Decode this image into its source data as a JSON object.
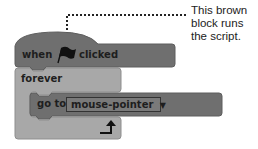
{
  "annotation": {
    "lines": [
      "This brown",
      "block runs",
      "the script."
    ]
  },
  "hat_block": {
    "label_before": "when",
    "icon": "green-flag-icon",
    "label_after": "clicked",
    "color": "#6f6f6f"
  },
  "forever_block": {
    "label": "forever",
    "color": "#a8a8a8",
    "loop_icon": "loop-arrow-icon"
  },
  "goto_block": {
    "label": "go to",
    "dropdown_value": "mouse-pointer",
    "dropdown_arrow": "▼",
    "color": "#6f6f6f"
  }
}
